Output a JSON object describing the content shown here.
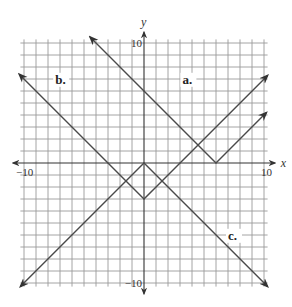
{
  "chart_data": {
    "type": "line",
    "title": "",
    "xlabel": "x",
    "ylabel": "y",
    "xlim": [
      -10,
      10
    ],
    "ylim": [
      -10,
      10
    ],
    "grid": true,
    "grid_step": 1,
    "tick_labels": {
      "x": [
        {
          "value": -10,
          "label": "−10"
        },
        {
          "value": 10,
          "label": "10"
        }
      ],
      "y": [
        {
          "value": 10,
          "label": "10"
        },
        {
          "value": -10,
          "label": "−10"
        }
      ]
    },
    "series": [
      {
        "name": "a.",
        "equation": "y = |x - 6|",
        "points": [
          [
            -4.5,
            10.5
          ],
          [
            6,
            0
          ],
          [
            10.2,
            4.2
          ]
        ],
        "label_pos": [
          3.2,
          6.6
        ]
      },
      {
        "name": "b.",
        "equation": "y = |x| - 3",
        "points": [
          [
            -10.4,
            7.4
          ],
          [
            0,
            -3
          ],
          [
            10.3,
            7.3
          ]
        ],
        "label_pos": [
          -7.4,
          6.6
        ]
      },
      {
        "name": "c.",
        "equation": "y = -|x|",
        "points": [
          [
            -10.3,
            -10.3
          ],
          [
            0,
            0
          ],
          [
            10.3,
            -10.3
          ]
        ],
        "label_pos": [
          7.0,
          -6.4
        ]
      }
    ]
  },
  "layout": {
    "origin_px": [
      144,
      163
    ],
    "unit_px": 12,
    "grid_extent": 10.3,
    "axis_extent": 10.9,
    "line_color": "#4a4a4a",
    "grid_color": "#9a9a9a"
  }
}
